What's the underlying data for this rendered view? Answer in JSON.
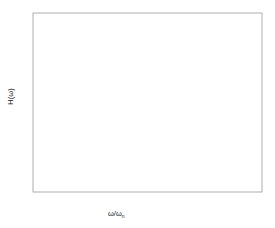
{
  "chart_data": {
    "type": "line",
    "title": "",
    "xlabel": "ω/ω",
    "xlabel_sub": "n",
    "ylabel": "H(ω)",
    "xlim": [
      0,
      3
    ],
    "ylim": [
      0,
      5.5
    ],
    "xticks": [
      "0",
      "0.5",
      "1",
      "1.5",
      "2",
      "2.5",
      "3"
    ],
    "xtick_values": [
      0,
      0.5,
      1,
      1.5,
      2,
      2.5,
      3
    ],
    "yticks": [
      "0",
      "1",
      "2",
      "3",
      "4",
      "5"
    ],
    "ytick_values": [
      0,
      1,
      2,
      3,
      4,
      5
    ],
    "grid": false,
    "legend_position": "inline-annotations",
    "formula": "H = 1 / sqrt((1-r^2)^2 + (2*zeta*r)^2)",
    "series": [
      {
        "name": "ξ = 0.05",
        "zeta": 0.05,
        "peak_value": 10.01,
        "peak_x": 0.9975,
        "clipped_at_top": true,
        "color": "#555555"
      },
      {
        "name": "ξ = 0.1",
        "zeta": 0.1,
        "peak_value": 5.03,
        "peak_x": 0.99,
        "clipped_at_top": false,
        "color": "#555555"
      },
      {
        "name": "ξ = 0.15",
        "zeta": 0.15,
        "peak_value": 3.37,
        "peak_x": 0.977,
        "clipped_at_top": false,
        "color": "#555555"
      },
      {
        "name": "ξ = 0.25",
        "zeta": 0.25,
        "peak_value": 2.066,
        "peak_x": 0.935,
        "clipped_at_top": false,
        "color": "#555555"
      },
      {
        "name": "ξ = 0.5",
        "zeta": 0.5,
        "peak_value": 1.155,
        "peak_x": 0.707,
        "clipped_at_top": false,
        "color": "#555555"
      },
      {
        "name": "ξ = 1.0",
        "zeta": 1.0,
        "peak_value": 1.0,
        "peak_x": 0.0,
        "clipped_at_top": false,
        "color": "#555555"
      }
    ],
    "annotations": [
      {
        "text": "ξ = 0.05",
        "series": 0,
        "label_x": 142,
        "label_y": 21,
        "arrow_from_x": 140,
        "arrow_from_y": 27,
        "arrow_to_x": 112,
        "arrow_to_y": 42
      },
      {
        "text": "ξ = 0.1",
        "series": 1,
        "label_x": 142,
        "label_y": 43,
        "arrow_from_x": 140,
        "arrow_from_y": 46,
        "arrow_to_x": 108,
        "arrow_to_y": 46
      },
      {
        "text": "ξ = 0.15",
        "series": 2,
        "label_x": 144,
        "label_y": 81,
        "arrow_from_x": 142,
        "arrow_from_y": 84,
        "arrow_to_x": 110,
        "arrow_to_y": 84
      },
      {
        "text": "ξ = 0.25",
        "series": 3,
        "label_x": 152,
        "label_y": 119,
        "arrow_from_x": 150,
        "arrow_from_y": 122,
        "arrow_to_x": 112,
        "arrow_to_y": 122
      },
      {
        "text": "ξ = 0.5",
        "series": 4,
        "label_x": 37,
        "label_y": 136,
        "arrow_from_x": 62,
        "arrow_from_y": 142,
        "arrow_to_x": 82,
        "arrow_to_y": 155
      },
      {
        "text": "ξ = 1.0",
        "series": 5,
        "label_x": 107,
        "label_y": 148,
        "arrow_from_x": 110,
        "arrow_from_y": 154,
        "arrow_to_x": 96,
        "arrow_to_y": 170
      }
    ]
  },
  "axes": {
    "frame_left": 33,
    "frame_right": 262,
    "frame_top": 13,
    "frame_bottom": 192
  }
}
